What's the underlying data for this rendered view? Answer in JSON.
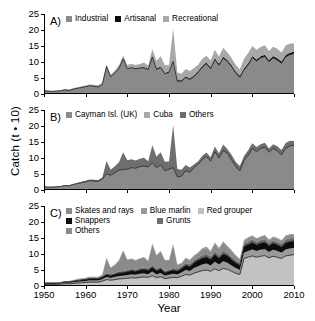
{
  "figure": {
    "ylabel": "Catch (t • 10)",
    "xlabel": "Year"
  },
  "axes": {
    "yticks": [
      0,
      5,
      10,
      15,
      20,
      25
    ],
    "ytick_labels": [
      "0",
      "5",
      "10",
      "15",
      "20",
      "25"
    ],
    "xticks": [
      1950,
      1960,
      1970,
      1980,
      1990,
      2000,
      2010
    ],
    "xtick_labels": [
      "1950",
      "1960",
      "1970",
      "1980",
      "1990",
      "2000",
      "2010"
    ],
    "ylim": [
      0,
      25
    ],
    "xlim": [
      1950,
      2010
    ],
    "grid": false
  },
  "colors": {
    "dark_gray": "#6e6e6e",
    "mid_gray": "#8a8a8a",
    "light_gray": "#a8a8a8",
    "pale_gray": "#bdbdbd",
    "very_light_gray": "#cfcfcf",
    "black": "#0d0d0d",
    "axis": "#000000",
    "background": "#ffffff"
  },
  "panels": [
    {
      "id": "A",
      "letter": "A)",
      "legend_rows": [
        [
          {
            "label": "Industrial",
            "color": "#8a8a8a"
          },
          {
            "label": "Artisanal",
            "color": "#0d0d0d"
          },
          {
            "label": "Recreational",
            "color": "#a8a8a8"
          }
        ]
      ]
    },
    {
      "id": "B",
      "letter": "B)",
      "legend_rows": [
        [
          {
            "label": "Cayman Isl. (UK)",
            "color": "#8a8a8a"
          },
          {
            "label": "Cuba",
            "color": "#a8a8a8"
          },
          {
            "label": "Others",
            "color": "#6e6e6e"
          }
        ]
      ]
    },
    {
      "id": "C",
      "letter": "C)",
      "legend_rows": [
        [
          {
            "label": "Skates and rays",
            "color": "#8a8a8a"
          },
          {
            "label": "Blue marlin",
            "color": "#9a9a9a"
          },
          {
            "label": "Red grouper",
            "color": "#c2c2c2"
          }
        ],
        [
          {
            "label": "Snappers",
            "color": "#0d0d0d"
          },
          {
            "label": "Grunts",
            "color": "#6e6e6e"
          }
        ],
        [
          {
            "label": "Others",
            "color": "#8a8a8a"
          }
        ]
      ]
    }
  ],
  "chart_data": [
    {
      "type": "area",
      "panel": "A",
      "title": "",
      "xlabel": "",
      "ylabel": "Catch (t • 10)",
      "xlim": [
        1950,
        2010
      ],
      "ylim": [
        0,
        25
      ],
      "stacked": true,
      "x": [
        1950,
        1951,
        1952,
        1953,
        1954,
        1955,
        1956,
        1957,
        1958,
        1959,
        1960,
        1961,
        1962,
        1963,
        1964,
        1965,
        1966,
        1967,
        1968,
        1969,
        1970,
        1971,
        1972,
        1973,
        1974,
        1975,
        1976,
        1977,
        1978,
        1979,
        1980,
        1981,
        1982,
        1983,
        1984,
        1985,
        1986,
        1987,
        1988,
        1989,
        1990,
        1991,
        1992,
        1993,
        1994,
        1995,
        1996,
        1997,
        1998,
        1999,
        2000,
        2001,
        2002,
        2003,
        2004,
        2005,
        2006,
        2007,
        2008,
        2009,
        2010
      ],
      "series": [
        {
          "name": "Industrial",
          "color": "#8a8a8a",
          "values": [
            1.0,
            0.9,
            0.8,
            0.9,
            1.0,
            1.3,
            1.1,
            1.5,
            1.8,
            2.0,
            2.3,
            2.6,
            2.4,
            2.2,
            3.0,
            8.6,
            5.4,
            6.6,
            8.0,
            11.0,
            7.9,
            8.2,
            7.9,
            8.1,
            8.2,
            7.6,
            11.6,
            7.7,
            8.3,
            6.3,
            6.8,
            10.2,
            4.0,
            4.0,
            5.2,
            4.5,
            5.5,
            6.8,
            8.4,
            9.5,
            7.9,
            10.8,
            9.0,
            11.2,
            10.2,
            8.6,
            6.6,
            5.2,
            7.5,
            9.1,
            11.4,
            10.3,
            11.3,
            11.7,
            10.1,
            11.3,
            10.6,
            9.6,
            11.6,
            12.3,
            12.6,
            9.2
          ]
        },
        {
          "name": "Artisanal",
          "color": "#0d0d0d",
          "values": [
            0.06,
            0.06,
            0.06,
            0.06,
            0.07,
            0.07,
            0.07,
            0.08,
            0.08,
            0.09,
            0.09,
            0.1,
            0.1,
            0.11,
            0.12,
            0.13,
            0.14,
            0.15,
            0.16,
            0.17,
            0.18,
            0.19,
            0.2,
            0.21,
            0.22,
            0.23,
            0.25,
            0.26,
            0.27,
            0.28,
            0.3,
            0.31,
            0.32,
            0.33,
            0.34,
            0.35,
            0.36,
            0.37,
            0.38,
            0.39,
            0.4,
            0.41,
            0.42,
            0.43,
            0.44,
            0.45,
            0.46,
            0.47,
            0.48,
            0.49,
            0.5,
            0.51,
            0.52,
            0.53,
            0.54,
            0.55,
            0.56,
            0.57,
            0.58,
            0.59,
            0.6
          ]
        },
        {
          "name": "Recreational",
          "color": "#a8a8a8",
          "values": [
            0.1,
            0.1,
            0.1,
            0.1,
            0.1,
            0.2,
            0.2,
            0.2,
            0.2,
            0.3,
            0.3,
            0.3,
            0.4,
            0.4,
            0.4,
            0.5,
            0.5,
            0.6,
            0.9,
            0.9,
            1.0,
            1.1,
            1.0,
            1.1,
            1.4,
            1.1,
            2.1,
            2.4,
            3.2,
            2.4,
            2.0,
            10.0,
            2.4,
            2.0,
            2.3,
            2.3,
            2.3,
            2.0,
            2.2,
            2.1,
            2.2,
            2.6,
            2.3,
            2.8,
            2.4,
            2.2,
            2.1,
            2.1,
            3.0,
            3.2,
            3.1,
            3.0,
            2.9,
            3.0,
            2.8,
            2.9,
            3.0,
            2.8,
            3.0,
            2.9,
            2.6,
            2.8
          ]
        }
      ]
    },
    {
      "type": "area",
      "panel": "B",
      "title": "",
      "xlabel": "",
      "ylabel": "Catch (t • 10)",
      "xlim": [
        1950,
        2010
      ],
      "ylim": [
        0,
        25
      ],
      "stacked": true,
      "x": [
        1950,
        1951,
        1952,
        1953,
        1954,
        1955,
        1956,
        1957,
        1958,
        1959,
        1960,
        1961,
        1962,
        1963,
        1964,
        1965,
        1966,
        1967,
        1968,
        1969,
        1970,
        1971,
        1972,
        1973,
        1974,
        1975,
        1976,
        1977,
        1978,
        1979,
        1980,
        1981,
        1982,
        1983,
        1984,
        1985,
        1986,
        1987,
        1988,
        1989,
        1990,
        1991,
        1992,
        1993,
        1994,
        1995,
        1996,
        1997,
        1998,
        1999,
        2000,
        2001,
        2002,
        2003,
        2004,
        2005,
        2006,
        2007,
        2008,
        2009,
        2010
      ],
      "series": [
        {
          "name": "Cayman Isl. (UK)",
          "color": "#8a8a8a",
          "values": [
            1.0,
            0.9,
            0.9,
            1.0,
            1.1,
            1.4,
            1.3,
            1.7,
            2.0,
            2.3,
            2.6,
            2.9,
            2.8,
            2.7,
            3.4,
            5.1,
            4.6,
            5.4,
            6.2,
            6.4,
            6.5,
            7.0,
            6.8,
            7.3,
            7.5,
            7.2,
            8.5,
            7.0,
            7.8,
            6.0,
            6.5,
            7.0,
            4.1,
            4.3,
            6.0,
            5.5,
            7.0,
            8.0,
            9.5,
            10.5,
            9.0,
            12.0,
            10.0,
            12.3,
            11.5,
            9.5,
            7.3,
            6.0,
            9.2,
            10.8,
            13.0,
            12.0,
            13.0,
            13.4,
            11.8,
            13.0,
            12.2,
            11.0,
            13.0,
            13.8,
            14.0,
            11.0
          ]
        },
        {
          "name": "Cuba",
          "color": "#a8a8a8",
          "values": [
            0.0,
            0.0,
            0.0,
            0.0,
            0.0,
            0.0,
            0.0,
            0.0,
            0.0,
            0.0,
            0.0,
            0.0,
            0.0,
            0.0,
            0.0,
            0.0,
            0.0,
            0.0,
            0.0,
            0.0,
            0.0,
            0.0,
            0.0,
            0.0,
            0.0,
            0.0,
            0.0,
            0.0,
            0.0,
            0.0,
            0.0,
            0.0,
            0.0,
            0.0,
            0.0,
            0.0,
            0.0,
            0.0,
            0.0,
            0.0,
            0.0,
            0.0,
            0.0,
            0.0,
            0.0,
            0.0,
            0.0,
            0.0,
            0.0,
            0.0,
            0.0,
            0.0,
            0.0,
            0.0,
            0.0,
            0.0,
            0.0,
            0.0,
            0.0,
            0.0,
            0.0
          ]
        },
        {
          "name": "Others",
          "color": "#6e6e6e",
          "values": [
            0.1,
            0.1,
            0.1,
            0.1,
            0.1,
            0.2,
            0.2,
            0.2,
            0.3,
            0.3,
            0.3,
            0.4,
            0.4,
            0.4,
            0.5,
            4.0,
            1.7,
            2.0,
            2.5,
            5.4,
            2.8,
            2.6,
            2.4,
            2.5,
            2.6,
            1.8,
            5.5,
            3.5,
            4.0,
            2.8,
            2.4,
            13.3,
            2.5,
            2.0,
            1.8,
            1.5,
            1.0,
            1.0,
            1.2,
            1.2,
            1.2,
            1.6,
            1.5,
            1.9,
            1.3,
            1.5,
            1.5,
            1.5,
            1.4,
            1.6,
            1.6,
            1.4,
            1.3,
            1.4,
            1.2,
            1.3,
            1.5,
            1.5,
            1.7,
            1.6,
            1.3,
            1.3
          ]
        }
      ]
    },
    {
      "type": "area",
      "panel": "C",
      "title": "",
      "xlabel": "Year",
      "ylabel": "Catch (t • 10)",
      "xlim": [
        1950,
        2010
      ],
      "ylim": [
        0,
        25
      ],
      "stacked": true,
      "x": [
        1950,
        1951,
        1952,
        1953,
        1954,
        1955,
        1956,
        1957,
        1958,
        1959,
        1960,
        1961,
        1962,
        1963,
        1964,
        1965,
        1966,
        1967,
        1968,
        1969,
        1970,
        1971,
        1972,
        1973,
        1974,
        1975,
        1976,
        1977,
        1978,
        1979,
        1980,
        1981,
        1982,
        1983,
        1984,
        1985,
        1986,
        1987,
        1988,
        1989,
        1990,
        1991,
        1992,
        1993,
        1994,
        1995,
        1996,
        1997,
        1998,
        1999,
        2000,
        2001,
        2002,
        2003,
        2004,
        2005,
        2006,
        2007,
        2008,
        2009,
        2010
      ],
      "series": [
        {
          "name": "Red grouper",
          "color": "#c2c2c2",
          "values": [
            0.5,
            0.5,
            0.5,
            0.5,
            0.6,
            0.7,
            0.7,
            0.8,
            0.9,
            1.0,
            1.1,
            1.2,
            1.2,
            1.2,
            1.5,
            2.0,
            1.8,
            2.0,
            2.2,
            2.3,
            2.4,
            2.6,
            2.5,
            2.7,
            2.8,
            2.7,
            3.2,
            2.6,
            2.9,
            2.3,
            2.5,
            2.7,
            2.6,
            3.0,
            3.6,
            3.4,
            4.0,
            4.4,
            4.8,
            5.0,
            4.6,
            5.4,
            4.8,
            5.5,
            5.2,
            4.6,
            4.0,
            3.6,
            8.6,
            9.0,
            9.4,
            9.0,
            9.3,
            9.5,
            8.8,
            9.3,
            9.0,
            8.6,
            9.4,
            9.6,
            9.8,
            8.4
          ]
        },
        {
          "name": "Blue marlin",
          "color": "#9a9a9a",
          "values": [
            0.2,
            0.2,
            0.2,
            0.2,
            0.2,
            0.3,
            0.3,
            0.3,
            0.4,
            0.4,
            0.5,
            0.5,
            0.5,
            0.5,
            0.6,
            0.8,
            0.7,
            0.8,
            0.9,
            0.9,
            1.0,
            1.0,
            1.0,
            1.1,
            1.1,
            1.0,
            1.3,
            1.0,
            1.2,
            0.9,
            1.0,
            1.1,
            1.0,
            1.2,
            1.4,
            1.3,
            1.6,
            1.8,
            1.9,
            2.0,
            1.8,
            2.2,
            1.9,
            2.2,
            2.1,
            1.8,
            1.6,
            1.4,
            1.8,
            1.9,
            2.0,
            1.9,
            2.0,
            2.0,
            1.8,
            2.0,
            1.9,
            1.8,
            2.0,
            2.1,
            2.1,
            1.8
          ]
        },
        {
          "name": "Snappers",
          "color": "#0d0d0d",
          "values": [
            0.2,
            0.2,
            0.2,
            0.2,
            0.2,
            0.3,
            0.3,
            0.4,
            0.4,
            0.5,
            0.5,
            0.6,
            0.6,
            0.6,
            0.7,
            0.8,
            0.8,
            0.9,
            1.0,
            1.0,
            1.1,
            1.2,
            1.1,
            1.2,
            1.3,
            1.2,
            1.4,
            1.2,
            1.3,
            1.0,
            1.1,
            1.2,
            1.1,
            1.3,
            1.5,
            1.4,
            1.7,
            1.9,
            2.0,
            2.1,
            1.9,
            2.3,
            2.0,
            2.3,
            2.2,
            1.9,
            1.7,
            1.5,
            2.0,
            2.1,
            2.2,
            2.0,
            2.1,
            2.2,
            2.0,
            2.1,
            2.0,
            1.9,
            2.1,
            2.2,
            2.2,
            1.9
          ]
        },
        {
          "name": "Grunts",
          "color": "#6e6e6e",
          "values": [
            0.1,
            0.1,
            0.1,
            0.1,
            0.1,
            0.1,
            0.1,
            0.2,
            0.2,
            0.2,
            0.2,
            0.3,
            0.3,
            0.3,
            0.3,
            0.4,
            0.4,
            0.4,
            0.5,
            0.5,
            0.5,
            0.6,
            0.5,
            0.6,
            0.6,
            0.6,
            0.7,
            0.6,
            0.6,
            0.5,
            0.5,
            0.6,
            0.5,
            0.6,
            0.7,
            0.7,
            0.8,
            0.9,
            1.0,
            1.0,
            0.9,
            1.1,
            1.0,
            1.1,
            1.0,
            0.9,
            0.8,
            0.7,
            0.9,
            1.0,
            1.0,
            0.9,
            1.0,
            1.0,
            0.9,
            1.0,
            0.9,
            0.9,
            1.0,
            1.0,
            1.0,
            0.9
          ]
        },
        {
          "name": "Skates and rays",
          "color": "#8a8a8a",
          "values": [
            0.1,
            0.1,
            0.1,
            0.1,
            0.1,
            0.1,
            0.1,
            0.1,
            0.2,
            0.2,
            0.2,
            0.2,
            0.2,
            0.2,
            0.3,
            4.6,
            1.9,
            2.4,
            3.3,
            6.3,
            3.1,
            3.0,
            2.8,
            2.9,
            3.1,
            2.2,
            6.4,
            4.1,
            4.7,
            3.3,
            2.8,
            7.3,
            1.3,
            0.9,
            1.3,
            1.1,
            1.1,
            1.2,
            1.7,
            1.8,
            1.4,
            2.2,
            1.8,
            2.4,
            1.7,
            1.7,
            1.3,
            1.0,
            0.8,
            0.9,
            0.9,
            0.8,
            0.8,
            0.9,
            0.7,
            0.8,
            0.9,
            0.8,
            1.0,
            1.0,
            0.8,
            0.7
          ]
        },
        {
          "name": "Others",
          "color": "#8a8a8a",
          "values": [
            0.05,
            0.05,
            0.05,
            0.05,
            0.05,
            0.1,
            0.1,
            0.1,
            0.1,
            0.1,
            0.1,
            0.1,
            0.1,
            0.1,
            0.2,
            0.2,
            0.2,
            0.2,
            0.2,
            0.2,
            0.2,
            0.2,
            0.2,
            0.2,
            0.2,
            0.2,
            0.3,
            0.2,
            0.2,
            0.2,
            0.2,
            0.2,
            0.2,
            0.2,
            0.3,
            0.3,
            0.3,
            0.3,
            0.4,
            0.4,
            0.3,
            0.4,
            0.4,
            0.4,
            0.4,
            0.3,
            0.3,
            0.3,
            0.3,
            0.3,
            0.3,
            0.3,
            0.3,
            0.3,
            0.3,
            0.3,
            0.3,
            0.3,
            0.3,
            0.3,
            0.3,
            0.3
          ]
        }
      ]
    }
  ]
}
